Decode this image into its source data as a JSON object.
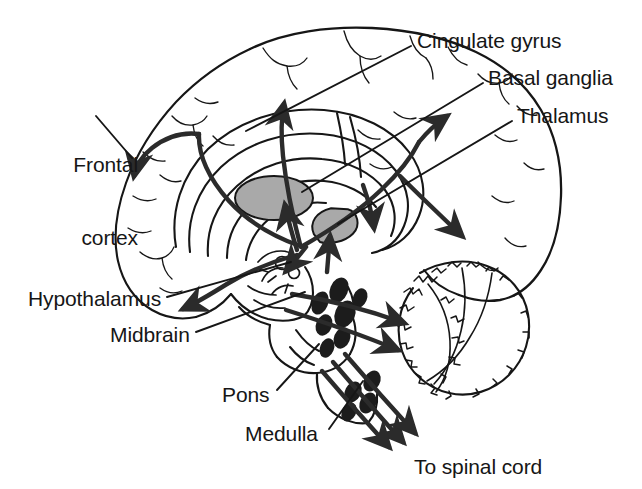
{
  "figure": {
    "kind": "sagittal-brain-diagram",
    "background_color": "#ffffff",
    "ink_color": "#161616",
    "nucleus_fill": "#1c1c1c",
    "deep_structure_fill": "#a9a9a9",
    "pathway_color": "#2b2b2b"
  },
  "labels": [
    {
      "id": "cingulate-gyrus",
      "text": "Cingulate gyrus",
      "x": 417,
      "y": 29,
      "align": "left",
      "leader": {
        "x1": 411,
        "y1": 46,
        "x2": 246,
        "y2": 131
      }
    },
    {
      "id": "basal-ganglia",
      "text": "Basal ganglia",
      "x": 488,
      "y": 66,
      "align": "left",
      "leader": {
        "x1": 483,
        "y1": 83,
        "x2": 302,
        "y2": 192
      }
    },
    {
      "id": "thalamus",
      "text": "Thalamus",
      "x": 517,
      "y": 104,
      "align": "left",
      "leader": {
        "x1": 512,
        "y1": 121,
        "x2": 338,
        "y2": 224
      }
    },
    {
      "id": "frontal-cortex",
      "text": "Frontal\ncortex",
      "line1": "Frontal",
      "line2": "cortex",
      "x": 28,
      "y": 104,
      "align": "right",
      "leader": {
        "x1": 96,
        "y1": 116,
        "x2": 132,
        "y2": 158
      }
    },
    {
      "id": "hypothalamus",
      "text": "Hypothalamus",
      "x": 28,
      "y": 287,
      "align": "left",
      "leader": {
        "x1": 167,
        "y1": 297,
        "x2": 291,
        "y2": 262
      }
    },
    {
      "id": "midbrain",
      "text": "Midbrain",
      "x": 110,
      "y": 323,
      "align": "left",
      "leader": {
        "x1": 196,
        "y1": 332,
        "x2": 305,
        "y2": 292
      }
    },
    {
      "id": "pons",
      "text": "Pons",
      "x": 222,
      "y": 383,
      "align": "left",
      "leader": {
        "x1": 277,
        "y1": 390,
        "x2": 319,
        "y2": 344
      }
    },
    {
      "id": "medulla",
      "text": "Medulla",
      "x": 245,
      "y": 422,
      "align": "left",
      "leader": {
        "x1": 329,
        "y1": 429,
        "x2": 363,
        "y2": 381
      }
    },
    {
      "id": "to-spinal-cord",
      "text": "To spinal cord",
      "x": 414,
      "y": 455,
      "align": "left",
      "leader": null
    }
  ],
  "structures": [
    {
      "id": "cerebral-cortex",
      "name": "cerebral cortex outline"
    },
    {
      "id": "corpus-callosum",
      "name": "corpus callosum arcs"
    },
    {
      "id": "basal-ganglia-body",
      "name": "basal ganglia",
      "fill": "#a9a9a9"
    },
    {
      "id": "thalamus-body",
      "name": "thalamus",
      "fill": "#a9a9a9"
    },
    {
      "id": "cerebellum",
      "name": "cerebellum"
    },
    {
      "id": "midbrain-body",
      "name": "midbrain"
    },
    {
      "id": "pons-body",
      "name": "pons"
    },
    {
      "id": "medulla-body",
      "name": "medulla"
    },
    {
      "id": "brainstem-nuclei",
      "name": "monoamine nuclei",
      "fill": "#1c1c1c",
      "count": 11
    }
  ],
  "pathways": [
    {
      "id": "cingulum-to-frontal",
      "target": "frontal cortex"
    },
    {
      "id": "ascending-to-cingulate",
      "target": "cingulate gyrus"
    },
    {
      "id": "ascending-to-basal-ganglia",
      "target": "basal ganglia"
    },
    {
      "id": "ascending-to-thalamus",
      "target": "thalamus"
    },
    {
      "id": "posterior-cortical",
      "target": "parieto-occipital cortex"
    },
    {
      "id": "to-cerebellum-upper",
      "target": "cerebellum"
    },
    {
      "id": "to-cerebellum-lower",
      "target": "cerebellum"
    },
    {
      "id": "descending-spinal",
      "target": "spinal cord",
      "count": 3
    }
  ]
}
